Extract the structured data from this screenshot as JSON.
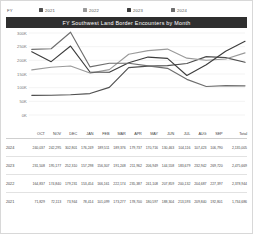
{
  "legend": {
    "title": "FY",
    "items": [
      {
        "label": "2021",
        "color": "#4f4f4f"
      },
      {
        "label": "2022",
        "color": "#9a9a9a"
      },
      {
        "label": "2023",
        "color": "#3d3d3d"
      },
      {
        "label": "2024",
        "color": "#6e6e6e"
      }
    ]
  },
  "chart_data": {
    "type": "line",
    "title": "FY Southwest Land Border Encounters by Month",
    "xlabel": "",
    "ylabel": "",
    "ylim": [
      0,
      300000
    ],
    "yticks": [
      "0K",
      "50K",
      "100K",
      "150K",
      "200K",
      "250K",
      "300K"
    ],
    "ytick_values": [
      0,
      50000,
      100000,
      150000,
      200000,
      250000,
      300000
    ],
    "grid": true,
    "legend_position": "top",
    "categories": [
      "OCT",
      "NOV",
      "DEC",
      "JAN",
      "FEB",
      "MAR",
      "APR",
      "MAY",
      "JUN",
      "JUL",
      "AUG",
      "SEP"
    ],
    "series": [
      {
        "name": "2021",
        "color": "#4f4f4f",
        "values": [
          71829,
          72113,
          73944,
          78414,
          101099,
          173277,
          178700,
          180597,
          188304,
          213593,
          209840,
          192801
        ],
        "total": "1,734,686"
      },
      {
        "name": "2022",
        "color": "#9a9a9a",
        "values": [
          164837,
          174840,
          179231,
          153454,
          166161,
          222174,
          235387,
          241108,
          207859,
          200132,
          204687,
          227397
        ],
        "total": "2,378,944"
      },
      {
        "name": "2023",
        "color": "#3d3d3d",
        "values": [
          231508,
          195177,
          252310,
          157298,
          156307,
          191248,
          211962,
          206949,
          144558,
          183679,
          232942,
          269720
        ],
        "total": "2,475,669"
      },
      {
        "name": "2024",
        "color": "#6e6e6e",
        "values": [
          240037,
          242295,
          302801,
          176249,
          189511,
          189376,
          179737,
          170716,
          130463,
          104116,
          107423,
          106790
        ],
        "total": "2,135,005"
      }
    ]
  },
  "table": {
    "year_header": "",
    "total_header": "Total",
    "months": [
      "OCT",
      "NOV",
      "DEC",
      "JAN",
      "FEB",
      "MAR",
      "APR",
      "MAY",
      "JUN",
      "JUL",
      "AUG",
      "SEP"
    ],
    "rows": [
      {
        "year": "2024",
        "values": [
          "240,037",
          "242,295",
          "302,801",
          "176,249",
          "189,511",
          "189,376",
          "179,737",
          "170,716",
          "130,463",
          "104,116",
          "107,423",
          "106,790"
        ],
        "total": "2,135,005"
      },
      {
        "year": "2023",
        "values": [
          "231,508",
          "195,177",
          "252,310",
          "157,298",
          "156,307",
          "191,248",
          "211,962",
          "206,949",
          "144,558",
          "183,679",
          "232,942",
          "269,720"
        ],
        "total": "2,475,669"
      },
      {
        "year": "2022",
        "values": [
          "164,837",
          "174,840",
          "179,231",
          "153,454",
          "166,161",
          "222,174",
          "235,387",
          "241,108",
          "207,859",
          "200,132",
          "204,687",
          "227,397"
        ],
        "total": "2,378,944"
      },
      {
        "year": "2021",
        "values": [
          "71,829",
          "72,113",
          "73,944",
          "78,414",
          "101,099",
          "173,277",
          "178,700",
          "180,597",
          "188,304",
          "213,593",
          "209,840",
          "192,801"
        ],
        "total": "1,734,686"
      }
    ]
  }
}
